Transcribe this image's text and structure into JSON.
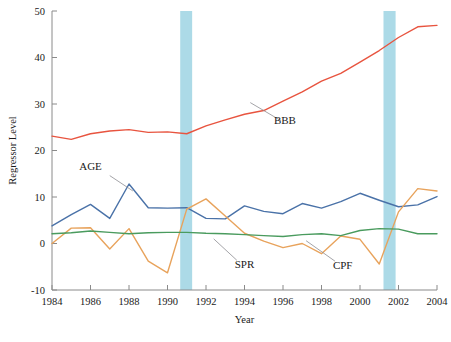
{
  "chart_data": {
    "type": "line",
    "title": "",
    "xlabel": "Year",
    "ylabel": "Regressor Level",
    "xlim": [
      1984,
      2004
    ],
    "ylim": [
      -10,
      50
    ],
    "grid": false,
    "legend_position": "inline-annotations",
    "xticks": [
      1984,
      1986,
      1988,
      1990,
      1992,
      1994,
      1996,
      1998,
      2000,
      2002,
      2004
    ],
    "yticks": [
      -10,
      0,
      10,
      20,
      30,
      40,
      50
    ],
    "x": [
      1984,
      1985,
      1986,
      1987,
      1988,
      1989,
      1990,
      1991,
      1992,
      1993,
      1994,
      1995,
      1996,
      1997,
      1998,
      1999,
      2000,
      2001,
      2002,
      2003,
      2004
    ],
    "series": [
      {
        "name": "BBB",
        "color": "#e8543f",
        "values": [
          23.1,
          22.4,
          23.6,
          24.2,
          24.5,
          23.9,
          24.0,
          23.6,
          25.3,
          26.6,
          27.8,
          28.6,
          30.6,
          32.6,
          34.9,
          36.6,
          39.0,
          41.5,
          44.3,
          46.6,
          46.9
        ]
      },
      {
        "name": "AGE",
        "color": "#4a72a8",
        "values": [
          3.8,
          6.2,
          8.4,
          5.4,
          12.8,
          7.7,
          7.6,
          7.7,
          5.4,
          5.3,
          8.1,
          6.9,
          6.4,
          8.6,
          7.6,
          9.0,
          10.8,
          9.3,
          7.9,
          8.3,
          10.1
        ]
      },
      {
        "name": "SPR",
        "color": "#e8a35c",
        "values": [
          0.0,
          3.3,
          3.4,
          -1.2,
          3.2,
          -3.8,
          -6.3,
          7.4,
          9.6,
          5.9,
          2.2,
          0.5,
          -0.9,
          0.0,
          -2.2,
          1.6,
          0.9,
          -4.4,
          6.8,
          11.8,
          11.3
        ]
      },
      {
        "name": "CPF",
        "color": "#4a9b5e",
        "values": [
          2.1,
          2.3,
          2.7,
          2.4,
          2.1,
          2.3,
          2.4,
          2.4,
          2.2,
          2.1,
          1.9,
          1.7,
          1.5,
          1.9,
          2.1,
          1.7,
          2.8,
          3.2,
          3.1,
          2.1,
          2.1
        ]
      }
    ],
    "shaded_bands": [
      {
        "label": "recession-band-1",
        "start": 1990.66,
        "end": 1991.28,
        "color": "#9ed3e3"
      },
      {
        "label": "recession-band-2",
        "start": 2001.22,
        "end": 2001.85,
        "color": "#9ed3e3"
      }
    ],
    "annotations": [
      {
        "text": "BBB",
        "x": 1996.1,
        "y": 25.6
      },
      {
        "text": "AGE",
        "x": 1986.0,
        "y": 15.9
      },
      {
        "text": "SPR",
        "x": 1994.0,
        "y": -5.3
      },
      {
        "text": "CPF",
        "x": 1999.1,
        "y": -5.4
      }
    ]
  }
}
